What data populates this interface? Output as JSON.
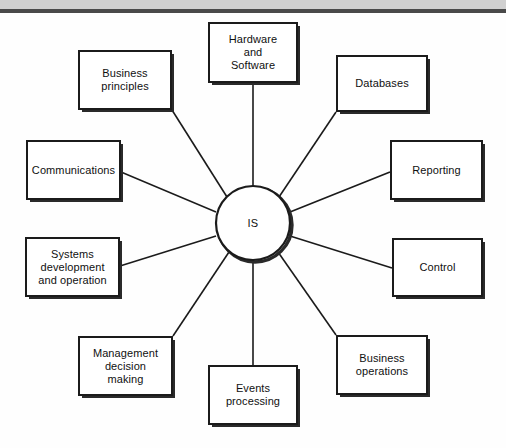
{
  "diagram": {
    "hub": {
      "label": "IS",
      "shape": "circle",
      "cx": 253,
      "cy": 223,
      "r": 37
    },
    "style": {
      "box_border_color": "#1b1b1b",
      "box_fill_color": "#ffffff",
      "line_color": "#1b1b1b",
      "text_color": "#101010",
      "top_band_color": "#d0d0d0",
      "top_rule_color": "#4a4a4a"
    },
    "nodes": [
      {
        "id": "hardware-software",
        "label": "Hardware\nand\nSoftware"
      },
      {
        "id": "business-principles",
        "label": "Business\nprinciples"
      },
      {
        "id": "databases",
        "label": "Databases"
      },
      {
        "id": "communications",
        "label": "Communications"
      },
      {
        "id": "reporting",
        "label": "Reporting"
      },
      {
        "id": "systems-development",
        "label": "Systems\ndevelopment\nand operation"
      },
      {
        "id": "control",
        "label": "Control"
      },
      {
        "id": "management-decision",
        "label": "Management\ndecision\nmaking"
      },
      {
        "id": "events-processing",
        "label": "Events\nprocessing"
      },
      {
        "id": "business-operations",
        "label": "Business\noperations"
      }
    ],
    "connections": [
      {
        "from": "hub",
        "to": "hardware-software"
      },
      {
        "from": "hub",
        "to": "business-principles"
      },
      {
        "from": "hub",
        "to": "databases"
      },
      {
        "from": "hub",
        "to": "communications"
      },
      {
        "from": "hub",
        "to": "reporting"
      },
      {
        "from": "hub",
        "to": "systems-development"
      },
      {
        "from": "hub",
        "to": "control"
      },
      {
        "from": "hub",
        "to": "management-decision"
      },
      {
        "from": "hub",
        "to": "events-processing"
      },
      {
        "from": "hub",
        "to": "business-operations"
      }
    ]
  }
}
